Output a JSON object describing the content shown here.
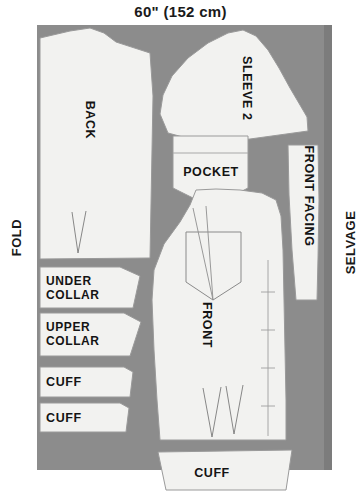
{
  "diagram": {
    "title_top": "60\" (152 cm)",
    "edge_left": "FOLD",
    "edge_right": "SELVAGE",
    "colors": {
      "page_background": "#ffffff",
      "fabric": "#8c8c8c",
      "fabric_shadow": "#7c7c7c",
      "piece_fill": "#f2f2f0",
      "piece_fill_alt": "#e9e9e6",
      "piece_outline": "#9a9a9a",
      "marking_line": "#6e6e6e",
      "text": "#141414"
    },
    "fabric_rect": {
      "x": 37,
      "y": 25,
      "width": 295,
      "height": 445
    }
  },
  "pieces": [
    {
      "id": "back",
      "label": "BACK",
      "orientation": "vertical",
      "label_x": 86,
      "label_y": 120
    },
    {
      "id": "sleeve-2",
      "label": "SLEEVE 2",
      "orientation": "vertical",
      "label_x": 243,
      "label_y": 58
    },
    {
      "id": "pocket",
      "label": "POCKET",
      "orientation": "horizontal",
      "label_x": 183,
      "label_y": 172
    },
    {
      "id": "front",
      "label": "FRONT",
      "orientation": "vertical",
      "label_x": 203,
      "label_y": 318
    },
    {
      "id": "front-facing",
      "label": "FRONT FACING",
      "orientation": "vertical",
      "label_x": 303,
      "label_y": 200
    },
    {
      "id": "under-collar",
      "label": "UNDER COLLAR",
      "orientation": "horizontal",
      "label_x": 46,
      "label_y": 285,
      "lines": [
        "UNDER",
        "COLLAR"
      ]
    },
    {
      "id": "upper-collar",
      "label": "UPPER COLLAR",
      "orientation": "horizontal",
      "label_x": 46,
      "label_y": 331,
      "lines": [
        "UPPER",
        "COLLAR"
      ]
    },
    {
      "id": "cuff-1",
      "label": "CUFF",
      "orientation": "horizontal",
      "label_x": 46,
      "label_y": 385
    },
    {
      "id": "cuff-2",
      "label": "CUFF",
      "orientation": "horizontal",
      "label_x": 46,
      "label_y": 421
    },
    {
      "id": "cuff-3",
      "label": "CUFF",
      "orientation": "horizontal",
      "label_x": 210,
      "label_y": 476
    }
  ]
}
